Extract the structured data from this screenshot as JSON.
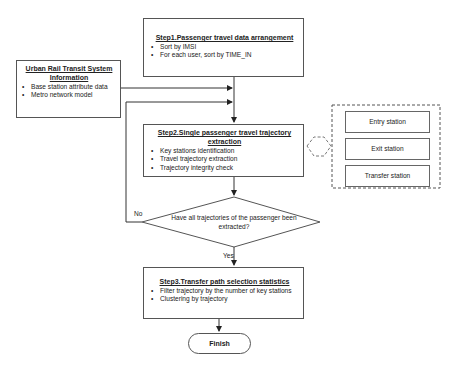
{
  "step1": {
    "title": "Step1.Passenger travel data arrangement",
    "items": [
      "Sort by IMSI",
      "For each user, sort by TIME_IN"
    ]
  },
  "info": {
    "title": "Urban Rail Transit System Information",
    "items": [
      "Base station attribute data",
      "Metro network model"
    ]
  },
  "step2": {
    "title": "Step2.Single passenger travel trajectory extraction",
    "items": [
      "Key stations identification",
      "Travel trajectory extraction",
      "Trajectory integrity check"
    ]
  },
  "stations": {
    "items": [
      "Entry station",
      "Exit station",
      "Transfer station"
    ]
  },
  "decision": {
    "text": "Have all trajectories of the passenger been extracted?",
    "no_label": "No",
    "yes_label": "Yes"
  },
  "step3": {
    "title": "Step3.Transfer path selection statistics",
    "items": [
      "Filter trajectory by the number of key stations",
      "Clustering by trajectory"
    ]
  },
  "terminal": {
    "finish_label": "Finish"
  }
}
